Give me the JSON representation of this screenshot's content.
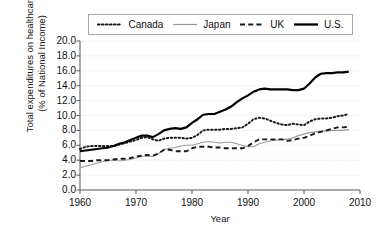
{
  "chart_data": {
    "type": "line",
    "title": "",
    "xlabel": "Year",
    "ylabel": "Total expenditures on healthcare (% of National Income)",
    "ylabel_line1": "Total expenditures on healthcare",
    "ylabel_line2": "(% of National Income)",
    "xlim": [
      1960,
      2010
    ],
    "ylim": [
      0.0,
      20.0
    ],
    "grid": true,
    "legend_position": "top",
    "xticks": [
      "1960",
      "1970",
      "1980",
      "1990",
      "2000",
      "2010"
    ],
    "xtick_values": [
      1960,
      1970,
      1980,
      1990,
      2000,
      2010
    ],
    "yticks": [
      "0.0",
      "2.0",
      "4.0",
      "6.0",
      "8.0",
      "10.0",
      "12.0",
      "14.0",
      "16.0",
      "18.0",
      "20.0"
    ],
    "ytick_values": [
      0,
      2,
      4,
      6,
      8,
      10,
      12,
      14,
      16,
      18,
      20
    ],
    "x": [
      1960,
      1961,
      1962,
      1963,
      1964,
      1965,
      1966,
      1967,
      1968,
      1969,
      1970,
      1971,
      1972,
      1973,
      1974,
      1975,
      1976,
      1977,
      1978,
      1979,
      1980,
      1981,
      1982,
      1983,
      1984,
      1985,
      1986,
      1987,
      1988,
      1989,
      1990,
      1991,
      1992,
      1993,
      1994,
      1995,
      1996,
      1997,
      1998,
      1999,
      2000,
      2001,
      2002,
      2003,
      2004,
      2005,
      2006,
      2007,
      2008
    ],
    "series": [
      {
        "name": "Canada",
        "style": "dotted",
        "color": "#1a1a1a",
        "width": 2.0,
        "values": [
          5.5,
          5.8,
          5.9,
          5.9,
          5.9,
          5.9,
          5.9,
          6.1,
          6.3,
          6.5,
          6.7,
          7.0,
          7.1,
          6.8,
          6.6,
          6.9,
          7.0,
          7.0,
          7.0,
          6.9,
          7.0,
          7.4,
          8.0,
          8.1,
          8.1,
          8.1,
          8.2,
          8.2,
          8.3,
          8.4,
          8.9,
          9.5,
          9.7,
          9.6,
          9.3,
          9.0,
          8.8,
          8.7,
          8.9,
          8.8,
          8.7,
          9.2,
          9.5,
          9.6,
          9.6,
          9.7,
          9.9,
          10.0,
          10.2
        ]
      },
      {
        "name": "Japan",
        "style": "solid",
        "color": "#9a9a9a",
        "width": 1.1,
        "values": [
          3.0,
          3.2,
          3.4,
          3.6,
          3.8,
          4.0,
          4.0,
          3.9,
          4.0,
          4.1,
          4.3,
          4.5,
          4.6,
          4.5,
          4.9,
          5.4,
          5.6,
          5.7,
          5.9,
          6.0,
          6.0,
          6.2,
          6.4,
          6.5,
          6.4,
          6.3,
          6.4,
          6.4,
          6.2,
          6.0,
          5.8,
          5.8,
          6.2,
          6.4,
          6.6,
          6.7,
          6.8,
          6.8,
          7.0,
          7.3,
          7.5,
          7.7,
          7.8,
          7.9,
          7.9,
          8.0,
          8.0,
          8.0,
          8.1
        ]
      },
      {
        "name": "UK",
        "style": "dashed",
        "color": "#1a1a1a",
        "width": 1.9,
        "values": [
          3.9,
          3.9,
          3.9,
          4.0,
          4.0,
          4.0,
          4.1,
          4.2,
          4.2,
          4.3,
          4.5,
          4.6,
          4.7,
          4.6,
          4.9,
          5.4,
          5.4,
          5.2,
          5.2,
          5.2,
          5.6,
          5.8,
          5.8,
          5.8,
          5.7,
          5.7,
          5.6,
          5.6,
          5.6,
          5.6,
          5.9,
          6.4,
          6.8,
          6.8,
          6.8,
          6.8,
          6.8,
          6.6,
          6.7,
          6.9,
          7.0,
          7.3,
          7.6,
          7.8,
          8.0,
          8.2,
          8.4,
          8.4,
          8.5
        ]
      },
      {
        "name": "U.S.",
        "style": "solid",
        "color": "#000000",
        "width": 2.2,
        "values": [
          5.2,
          5.3,
          5.4,
          5.5,
          5.6,
          5.7,
          5.9,
          6.2,
          6.4,
          6.7,
          7.0,
          7.3,
          7.3,
          7.1,
          7.5,
          8.0,
          8.2,
          8.3,
          8.2,
          8.4,
          9.0,
          9.5,
          10.1,
          10.2,
          10.2,
          10.5,
          10.8,
          11.2,
          11.8,
          12.3,
          12.7,
          13.2,
          13.5,
          13.6,
          13.5,
          13.5,
          13.5,
          13.5,
          13.4,
          13.4,
          13.6,
          14.3,
          15.1,
          15.6,
          15.7,
          15.7,
          15.8,
          15.8,
          15.9
        ]
      }
    ]
  },
  "legend": {
    "entries": [
      {
        "label": "Canada",
        "style": "dotted",
        "color": "#1a1a1a"
      },
      {
        "label": "Japan",
        "style": "solid",
        "color": "#9a9a9a"
      },
      {
        "label": "UK",
        "style": "dashed",
        "color": "#1a1a1a"
      },
      {
        "label": "U.S.",
        "style": "solid",
        "color": "#000000"
      }
    ]
  },
  "axis": {
    "x_title": "Year",
    "y_title_line1": "Total expenditures on healthcare",
    "y_title_line2": "(% of National Income)"
  },
  "colors": {
    "grid": "#d9d9d9",
    "axis": "#555555",
    "background": "#ffffff"
  }
}
